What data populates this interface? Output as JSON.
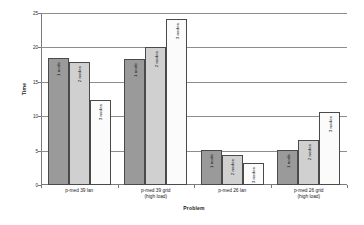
{
  "chart_data": {
    "type": "bar",
    "title": "",
    "subtitle": "",
    "xlabel": "Problem",
    "ylabel": "Time",
    "ylim": [
      0,
      25
    ],
    "yticks": [
      0,
      5,
      10,
      15,
      20,
      25
    ],
    "ytick_labels": [
      "0",
      "5",
      "10",
      "15",
      "20",
      "25"
    ],
    "grid": true,
    "grid_axis": "y",
    "legend": "none",
    "legend_position": "inline-bar-labels",
    "orientation": "vertical",
    "categories": [
      "p-med 39 lan",
      "p-med 39 grid (high load)",
      "p-med 26 lan",
      "p-med 26 grid (high load)"
    ],
    "category_lines": [
      [
        "p-med 39 lan",
        ""
      ],
      [
        "p-med 39 grid",
        "(high load)"
      ],
      [
        "p-med 26 lan",
        ""
      ],
      [
        "p-med 26 grid",
        "(high load)"
      ]
    ],
    "series": [
      {
        "name": "1 node",
        "color": "#9a9a9a",
        "values": [
          18.4,
          18.3,
          5.1,
          5.1
        ]
      },
      {
        "name": "2 nodes",
        "color": "#d0d0d0",
        "values": [
          17.9,
          20.1,
          4.3,
          6.6
        ]
      },
      {
        "name": "3 nodes",
        "color": "#fbfbfb",
        "values": [
          12.4,
          24.2,
          3.2,
          10.6
        ]
      }
    ],
    "bar_labels": [
      [
        "1 node",
        "2 nodes",
        "3 nodes"
      ],
      [
        "1 node",
        "2 nodes",
        "3 nodes"
      ],
      [
        "1 node",
        "2 nodes",
        "3 nodes"
      ],
      [
        "1 node",
        "2 nodes",
        "3 nodes"
      ]
    ],
    "colors": {
      "series_1_node": "#9a9a9a",
      "series_2_nodes": "#d0d0d0",
      "series_3_nodes": "#fbfbfb",
      "bar_outline": "#4a4a4a",
      "axis": "#7a7a7a",
      "gridline": "#8d8d8d",
      "background": "#ffffff",
      "text": "#1a1a1a"
    }
  }
}
